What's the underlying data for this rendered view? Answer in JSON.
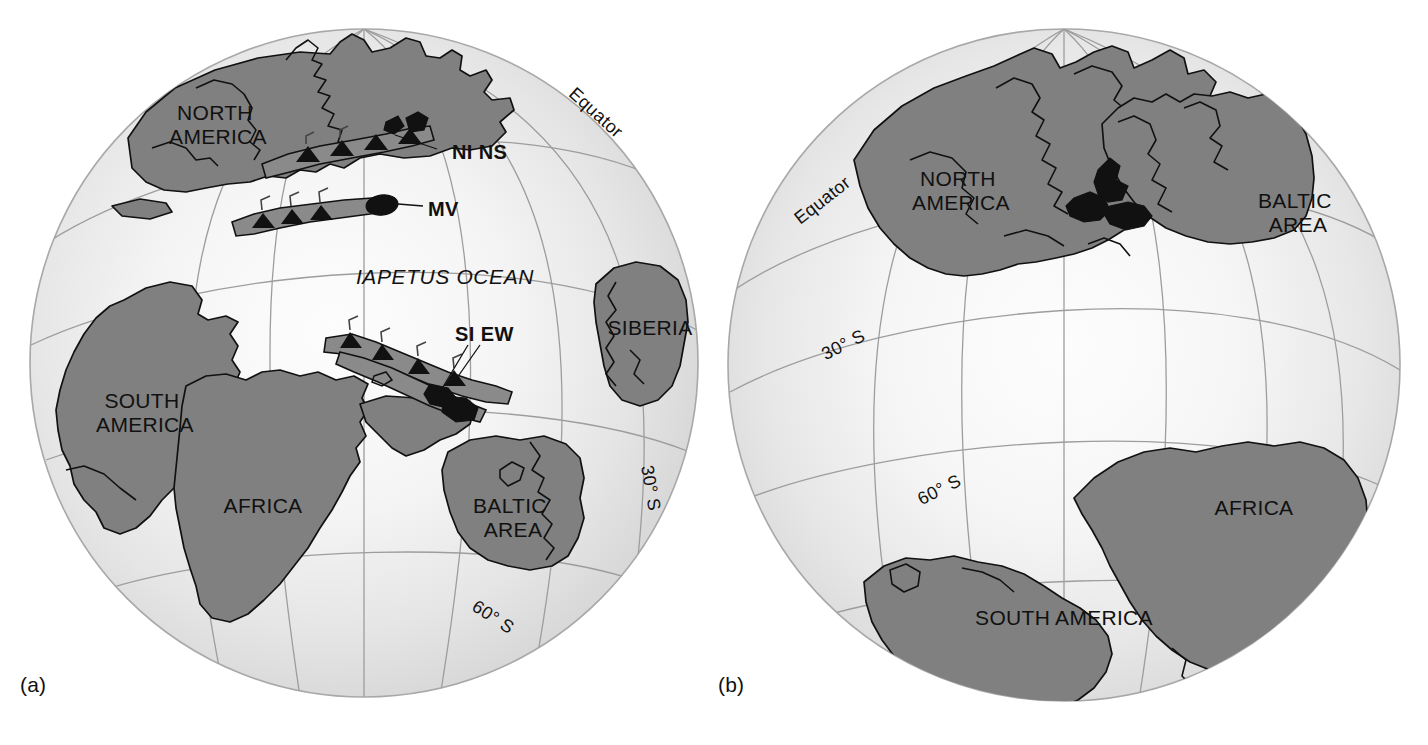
{
  "figure": {
    "type": "paleogeographic-reconstruction",
    "width": 1428,
    "height": 745,
    "background": "#ffffff"
  },
  "colors": {
    "continent": "#808080",
    "continent_outline": "#101010",
    "ocean_edge": "#d6d6d6",
    "ocean_center": "#fbfbfb",
    "graticule": "#9a9a9a",
    "arc_fill": "#8a8a8a",
    "blob": "#111111",
    "text": "#111111"
  },
  "panels": [
    {
      "id": "a",
      "label": "(a)",
      "globe": {
        "cx": 364,
        "cy": 363,
        "r": 334
      },
      "continents": [
        {
          "name": "NORTH AMERICA",
          "lines": [
            "NORTH",
            "AMERICA"
          ],
          "x": 218,
          "y": 120
        },
        {
          "name": "SOUTH AMERICA",
          "lines": [
            "SOUTH",
            "AMERICA"
          ],
          "x": 145,
          "y": 408
        },
        {
          "name": "AFRICA",
          "lines": [
            "AFRICA"
          ],
          "x": 263,
          "y": 513
        },
        {
          "name": "BALTIC AREA",
          "lines": [
            "BALTIC",
            "AREA"
          ],
          "x": 513,
          "y": 513
        },
        {
          "name": "SIBERIA",
          "lines": [
            "SIBERIA"
          ],
          "x": 650,
          "y": 335
        }
      ],
      "oceans": [
        {
          "name": "IAPETUS OCEAN",
          "x": 445,
          "y": 284
        }
      ],
      "arcs": [
        {
          "name": "NI NS",
          "x": 482,
          "y": 152,
          "leader_from": [
            437,
            149
          ],
          "leader_to": [
            395,
            135
          ]
        },
        {
          "name": "MV",
          "x": 440,
          "y": 209,
          "leader_from": [
            423,
            206
          ],
          "leader_to": [
            398,
            204
          ]
        },
        {
          "name": "SI EW",
          "x": 486,
          "y": 334,
          "leader_from": [
            480,
            345
          ],
          "leader_to": [
            452,
            385
          ]
        }
      ],
      "graticule_labels": [
        {
          "text": "Equator",
          "x": 592,
          "y": 117,
          "rotation": 42
        },
        {
          "text": "30° S",
          "x": 645,
          "y": 489,
          "rotation": 80
        },
        {
          "text": "60° S",
          "x": 490,
          "y": 622,
          "rotation": 33
        }
      ]
    },
    {
      "id": "b",
      "label": "(b)",
      "globe": {
        "cx": 350,
        "cy": 365,
        "r": 336
      },
      "continents": [
        {
          "name": "NORTH AMERICA",
          "lines": [
            "NORTH",
            "AMERICA"
          ],
          "x": 247,
          "y": 186
        },
        {
          "name": "BALTIC AREA",
          "lines": [
            "BALTIC",
            "AREA"
          ],
          "x": 584,
          "y": 208
        },
        {
          "name": "AFRICA",
          "lines": [
            "AFRICA"
          ],
          "x": 540,
          "y": 515
        },
        {
          "name": "SOUTH AMERICA",
          "lines": [
            "SOUTH AMERICA"
          ],
          "x": 350,
          "y": 625
        }
      ],
      "oceans": [],
      "arcs": [],
      "graticule_labels": [
        {
          "text": "Equator",
          "x": 112,
          "y": 205,
          "rotation": -38
        },
        {
          "text": "30° S",
          "x": 132,
          "y": 350,
          "rotation": -27
        },
        {
          "text": "60° S",
          "x": 228,
          "y": 495,
          "rotation": -27
        }
      ]
    }
  ],
  "legend_semantics": {
    "arc_abbreviations": [
      "NI NS",
      "MV",
      "SI EW"
    ],
    "ocean": "IAPETUS OCEAN",
    "latitudes": [
      "Equator",
      "30° S",
      "60° S"
    ]
  }
}
